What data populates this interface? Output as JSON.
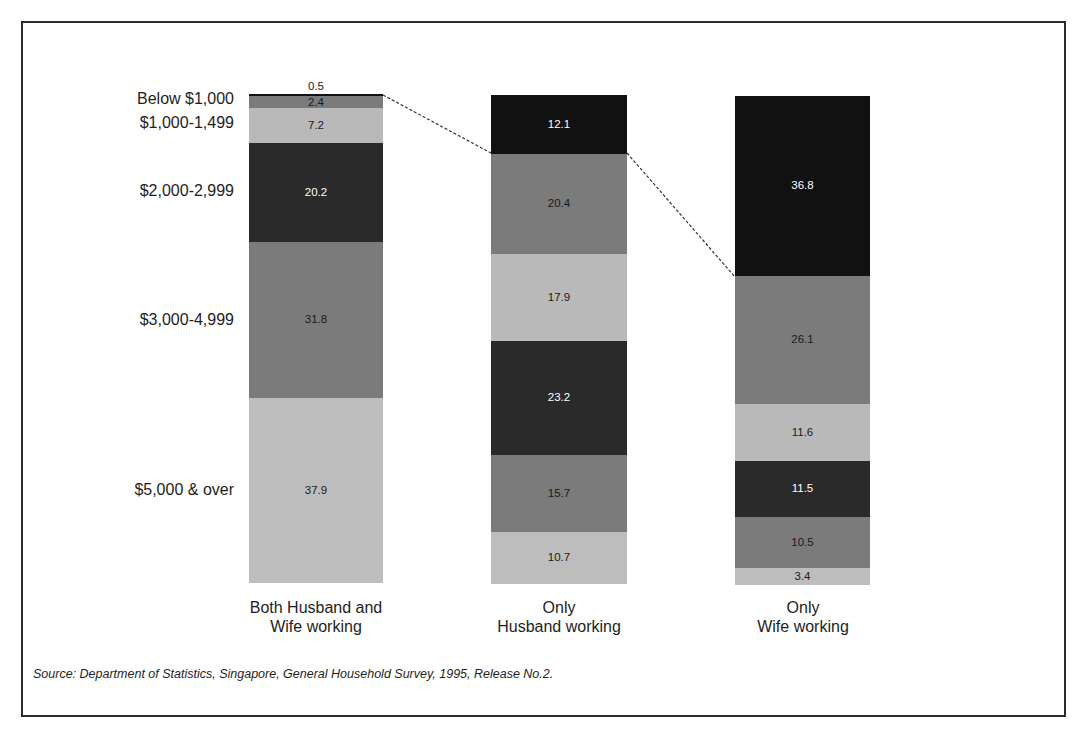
{
  "chart_data": {
    "type": "bar",
    "stacked": true,
    "percent": true,
    "title": "",
    "xlabel": "",
    "ylabel": "",
    "categories": [
      "Both Husband and Wife working",
      "Only Husband working",
      "Only Wife working"
    ],
    "category_labels": [
      {
        "line1": "Both Husband and",
        "line2": "Wife working"
      },
      {
        "line1": "Only",
        "line2": "Husband working"
      },
      {
        "line1": "Only",
        "line2": "Wife working"
      }
    ],
    "income_labels_visible": [
      "Below $1,000",
      "$1,000-1,499",
      "$2,000-2,999",
      "$3,000-4,999",
      "$5,000 & over"
    ],
    "series_order_top_to_bottom": [
      "Below $1,000",
      "$1,000-1,499",
      "$1,500-1,999",
      "$2,000-2,999",
      "$3,000-4,999",
      "$5,000 & over"
    ],
    "series": [
      {
        "name": "Segment 1 (top)",
        "values": [
          0.5,
          12.1,
          36.8
        ]
      },
      {
        "name": "Segment 2",
        "values": [
          2.4,
          20.4,
          26.1
        ]
      },
      {
        "name": "Segment 3",
        "values": [
          7.2,
          17.9,
          11.6
        ]
      },
      {
        "name": "Segment 4",
        "values": [
          20.2,
          23.2,
          11.5
        ]
      },
      {
        "name": "Segment 5",
        "values": [
          31.8,
          15.7,
          10.5
        ]
      },
      {
        "name": "Segment 6 (bottom)",
        "values": [
          37.9,
          10.7,
          3.4
        ]
      }
    ],
    "bars": [
      {
        "segments": [
          "0.5",
          "2.4",
          "7.2",
          "20.2",
          "31.8",
          "37.9"
        ]
      },
      {
        "segments": [
          "12.1",
          "20.4",
          "17.9",
          "23.2",
          "15.7",
          "10.7"
        ]
      },
      {
        "segments": [
          "36.8",
          "26.1",
          "11.6",
          "11.5",
          "10.5",
          "3.4"
        ]
      }
    ],
    "colors": [
      "#111111",
      "#7b7b7b",
      "#b9b9b9",
      "#2a2a2a",
      "#7b7b7b",
      "#bdbdbd"
    ],
    "connector_lines": "dashed lines linking top-segment boundaries between adjacent bars",
    "ylim": [
      0,
      100
    ],
    "grid": false,
    "legend": "left-side labels"
  },
  "source": "Source: Department of Statistics, Singapore, General Household Survey, 1995, Release No.2."
}
